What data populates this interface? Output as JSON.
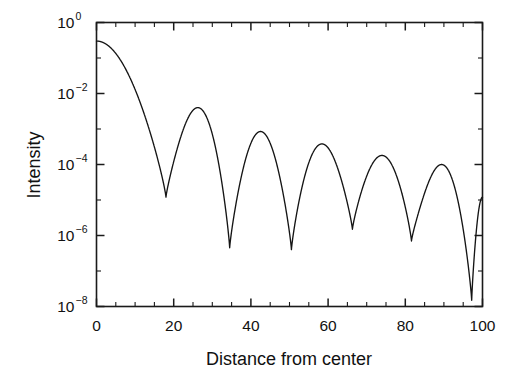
{
  "chart_data": {
    "type": "line",
    "title": "",
    "subtitle": "",
    "xlabel": "Distance from center",
    "ylabel": "Intensity",
    "yscale": "log",
    "xscale": "linear",
    "xlim": [
      0,
      100
    ],
    "ylim": [
      1e-08,
      1
    ],
    "grid": false,
    "legend": null,
    "xticks": [
      0,
      20,
      40,
      60,
      80,
      100
    ],
    "xticklabels": [
      "0",
      "20",
      "40",
      "60",
      "80",
      "100"
    ],
    "xminor_step": 5,
    "yticks": [
      1,
      0.01,
      0.0001,
      1e-06,
      1e-08
    ],
    "yticklabels": [
      "10^0",
      "10^-2",
      "10^-4",
      "10^-6",
      "10^-8"
    ],
    "ytick_mantissa": [
      "10",
      "10",
      "10",
      "10",
      "10"
    ],
    "ytick_exponent": [
      "0",
      "-2",
      "-4",
      "-6",
      "-8"
    ],
    "yminor_decades": [
      -1,
      -3,
      -5,
      -7
    ],
    "series": [
      {
        "name": "Airy diffraction intensity",
        "color": "#151515",
        "peak_value": 0.3,
        "minima_x": [
          18.0,
          34.5,
          50.5,
          66.3,
          81.6,
          97.2
        ],
        "minima_y": [
          1.2e-05,
          4.5e-07,
          4e-07,
          1.5e-06,
          7e-07,
          1.5e-08
        ],
        "lobe_peaks_x": [
          0,
          25.5,
          41.5,
          57.5,
          73.2,
          89.2,
          100
        ],
        "lobe_peaks_y": [
          0.3,
          0.004,
          0.00085,
          0.00038,
          0.00018,
          0.0001,
          1.2e-05
        ]
      }
    ]
  },
  "axes": {
    "x_label": "Distance from center",
    "y_label": "Intensity"
  },
  "figure": {
    "background": "#ffffff",
    "line_color": "#151515",
    "axis_color": "#1a1a1a"
  }
}
